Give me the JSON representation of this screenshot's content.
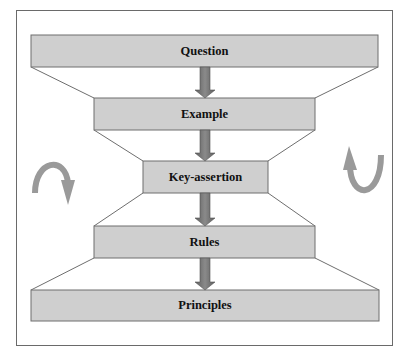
{
  "diagram": {
    "levels": [
      {
        "label": "Question"
      },
      {
        "label": "Example"
      },
      {
        "label": "Key-assertion"
      },
      {
        "label": "Rules"
      },
      {
        "label": "Principles"
      }
    ],
    "left_cycle_arrow": "clockwise-down",
    "right_cycle_arrow": "counterclockwise-up",
    "colors": {
      "box_fill": "#cfcfcf",
      "box_stroke": "#6e6e6e",
      "arrow_fill": "#7a7a7a",
      "cycle_arrow": "#9a9a9a",
      "frame": "#6a6a6a"
    }
  }
}
